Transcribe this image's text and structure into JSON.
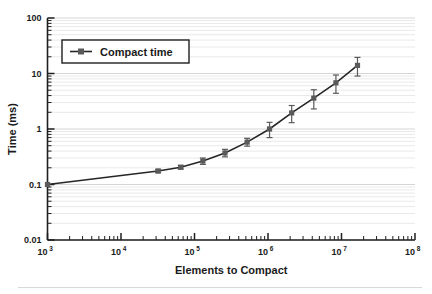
{
  "chart_data": {
    "type": "line",
    "title": "",
    "subtitle": "",
    "xlabel": "Elements to Compact",
    "ylabel": "Time (ms)",
    "xscale": "log",
    "yscale": "log",
    "xlim": [
      1000,
      100000000
    ],
    "ylim": [
      0.01,
      100
    ],
    "grid": true,
    "grid_axis": "y",
    "grid_minor": true,
    "legend": {
      "position": "upper-left",
      "entries": [
        {
          "name": "Compact time",
          "marker": "square",
          "line_color": "#262626",
          "marker_color": "#5a5a5a"
        }
      ]
    },
    "xticks": [
      {
        "value": 1000,
        "label": "10",
        "exponent": "3"
      },
      {
        "value": 10000,
        "label": "10",
        "exponent": "4"
      },
      {
        "value": 100000,
        "label": "10",
        "exponent": "5"
      },
      {
        "value": 1000000,
        "label": "10",
        "exponent": "6"
      },
      {
        "value": 10000000,
        "label": "10",
        "exponent": "7"
      },
      {
        "value": 100000000,
        "label": "10",
        "exponent": "8"
      }
    ],
    "yticks": [
      {
        "value": 0.01,
        "label": "0.01"
      },
      {
        "value": 0.1,
        "label": "0.1"
      },
      {
        "value": 1,
        "label": "1"
      },
      {
        "value": 10,
        "label": "10"
      },
      {
        "value": 100,
        "label": "100"
      }
    ],
    "series": [
      {
        "name": "Compact time",
        "x": [
          1000,
          32000,
          65000,
          130000,
          260000,
          520000,
          1050000,
          2100000,
          4200000,
          8400000,
          16500000
        ],
        "y": [
          0.1,
          0.175,
          0.205,
          0.265,
          0.37,
          0.58,
          1.0,
          1.95,
          3.6,
          6.8,
          14.0
        ],
        "yerr_low": [
          0.0,
          0.012,
          0.015,
          0.035,
          0.055,
          0.09,
          0.3,
          0.65,
          1.3,
          2.4,
          5.0
        ],
        "yerr_high": [
          0.0,
          0.012,
          0.015,
          0.035,
          0.06,
          0.1,
          0.32,
          0.7,
          1.5,
          2.6,
          5.5
        ]
      }
    ]
  }
}
